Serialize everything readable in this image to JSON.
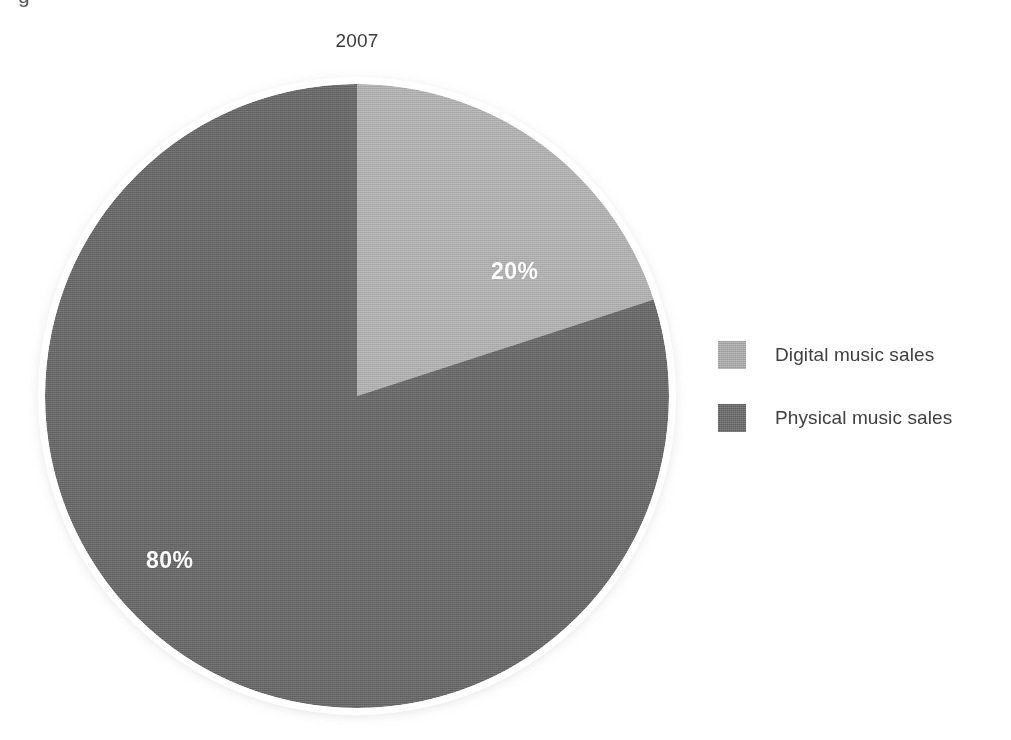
{
  "figure": {
    "caption_fragment": "g",
    "width": 1011,
    "height": 740
  },
  "chart_data": {
    "type": "pie",
    "title": "2007",
    "xlabel": "",
    "ylabel": "",
    "categories": [
      "Digital music sales",
      "Physical music sales"
    ],
    "values": [
      20,
      80
    ],
    "value_unit": "%",
    "data_labels": [
      "20%",
      "80%"
    ],
    "colors": [
      "#b0b0b0",
      "#6a6a6a"
    ],
    "start_angle_deg": 0,
    "direction": "clockwise",
    "grid": false,
    "legend_position": "right",
    "slices": [
      {
        "name": "Digital music sales",
        "value": 20,
        "label": "20%",
        "color": "#b0b0b0",
        "start_angle_deg": 0,
        "end_angle_deg": 72
      },
      {
        "name": "Physical music sales",
        "value": 80,
        "label": "80%",
        "color": "#6a6a6a",
        "start_angle_deg": 72,
        "end_angle_deg": 360
      }
    ]
  },
  "legend": {
    "items": [
      {
        "label": "Digital music sales",
        "color": "#b0b0b0"
      },
      {
        "label": "Physical music sales",
        "color": "#6a6a6a"
      }
    ]
  },
  "labels": {
    "digital_pct": "20%",
    "physical_pct": "80%"
  }
}
